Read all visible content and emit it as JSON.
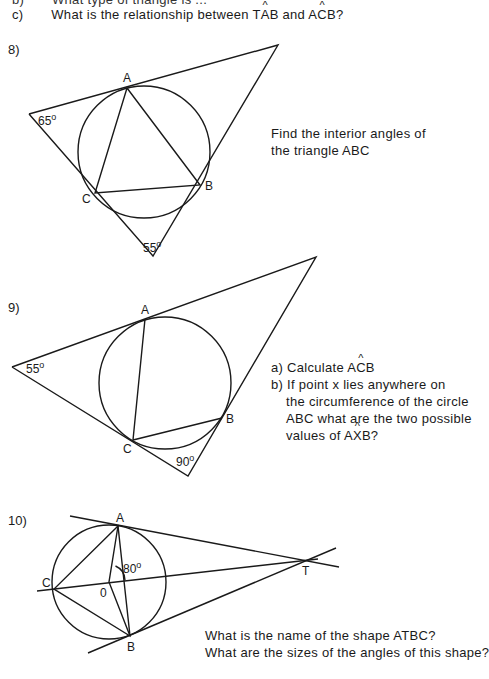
{
  "header": {
    "prev_line_label": "b)",
    "prev_line_text": "What type of triangle is ...",
    "line_c_label": "c)",
    "line_c_text_1": "What is the relationship between T",
    "line_c_angle_1_vertex": "A",
    "line_c_text_2": "B and A",
    "line_c_angle_2_vertex": "C",
    "line_c_text_3": "B?"
  },
  "questions": [
    {
      "number": "8)",
      "labels": {
        "A": "A",
        "B": "B",
        "C": "C"
      },
      "angles": [
        "65°",
        "55°"
      ],
      "angle_65_num": "65",
      "angle_55_num": "55",
      "degree_symbol": "o",
      "text_line_1": "Find the interior angles of",
      "text_line_2": "the triangle ABC"
    },
    {
      "number": "9)",
      "labels": {
        "A": "A",
        "B": "B",
        "C": "C"
      },
      "angle_55_num": "55",
      "angle_90_num": "90",
      "degree_symbol": "o",
      "part_a_label": "a)",
      "part_a_text": "Calculate A",
      "part_a_vertex": "C",
      "part_a_end": "B",
      "part_b_label": "b)",
      "part_b_line_1": "If point x lies anywhere on",
      "part_b_line_2": "the circumference of the circle",
      "part_b_line_3": "ABC what are the two possible",
      "part_b_line_4_start": "values of A",
      "part_b_vertex": "X",
      "part_b_end": "B?"
    },
    {
      "number": "10)",
      "labels": {
        "A": "A",
        "B": "B",
        "C": "C",
        "O": "0",
        "T": "T"
      },
      "angle_80_num": "80",
      "degree_symbol": "o",
      "text_line_1": "What is the name of the shape ATBC?",
      "text_line_2": "What are the sizes of the angles of this shape?"
    }
  ]
}
